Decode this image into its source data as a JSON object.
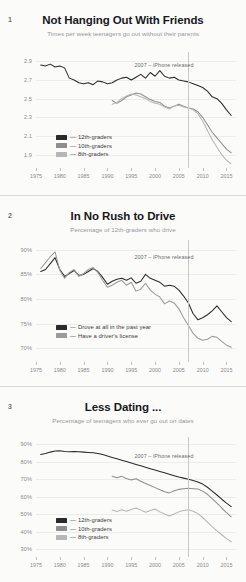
{
  "annotation": {
    "label": "2007 – iPhone released"
  },
  "xaxis": {
    "ticks": [
      1975,
      1980,
      1985,
      1990,
      1995,
      2000,
      2005,
      2010,
      2015
    ],
    "min": 1975,
    "max": 2017
  },
  "panels": [
    {
      "number": "1",
      "title": "Not Hanging Out With Friends",
      "subtitle": "Times per week teenagers go out without their parents",
      "ylabels": [
        "2.9",
        "2.7",
        "2.5",
        "2.3",
        "2.1",
        "1.9"
      ],
      "legend": [
        {
          "label": "12th-graders",
          "color": "#2b2b2d"
        },
        {
          "label": "10th-graders",
          "color": "#8e8e91"
        },
        {
          "label": "8th-graders",
          "color": "#b6b6b8"
        }
      ]
    },
    {
      "number": "2",
      "title": "In No Rush to Drive",
      "subtitle": "Percentage of 12th-graders who drive",
      "ylabels": [
        "90%",
        "85%",
        "80%",
        "75%",
        "70%"
      ],
      "legend": [
        {
          "label": "Drove at all in the past year",
          "color": "#2b2b2d"
        },
        {
          "label": "Have a driver's license",
          "color": "#9b9b9e"
        }
      ]
    },
    {
      "number": "3",
      "title": "Less Dating ...",
      "subtitle": "Percentage of teenagers who ever go out on dates",
      "ylabels": [
        "90%",
        "80%",
        "70%",
        "60%",
        "50%",
        "40%",
        "30%"
      ],
      "legend": [
        {
          "label": "12th-graders",
          "color": "#2b2b2d"
        },
        {
          "label": "10th-graders",
          "color": "#8e8e91"
        },
        {
          "label": "8th-graders",
          "color": "#b6b6b8"
        }
      ]
    }
  ],
  "chart_data": [
    {
      "type": "line",
      "title": "Not Hanging Out With Friends",
      "subtitle": "Times per week teenagers go out without their parents",
      "xlabel": "",
      "ylabel": "Times per week",
      "ylim": [
        1.8,
        3.0
      ],
      "xlim": [
        1975,
        2017
      ],
      "yticks": [
        1.9,
        2.1,
        2.3,
        2.5,
        2.7,
        2.9
      ],
      "grid": true,
      "legend_position": "lower-left",
      "annotations": [
        {
          "x": 2007,
          "text": "2007 – iPhone released",
          "type": "vline"
        }
      ],
      "series": [
        {
          "name": "12th-graders",
          "color": "#2b2b2d",
          "x": [
            1976,
            1977,
            1978,
            1979,
            1980,
            1981,
            1982,
            1983,
            1984,
            1985,
            1986,
            1987,
            1988,
            1989,
            1990,
            1991,
            1992,
            1993,
            1994,
            1995,
            1996,
            1997,
            1998,
            1999,
            2000,
            2001,
            2002,
            2003,
            2004,
            2005,
            2006,
            2007,
            2008,
            2009,
            2010,
            2011,
            2012,
            2013,
            2014,
            2015,
            2016
          ],
          "values": [
            2.86,
            2.85,
            2.87,
            2.84,
            2.85,
            2.83,
            2.72,
            2.7,
            2.67,
            2.66,
            2.67,
            2.65,
            2.69,
            2.68,
            2.66,
            2.67,
            2.7,
            2.72,
            2.73,
            2.7,
            2.73,
            2.76,
            2.72,
            2.78,
            2.74,
            2.8,
            2.74,
            2.72,
            2.73,
            2.7,
            2.69,
            2.68,
            2.66,
            2.64,
            2.62,
            2.58,
            2.52,
            2.5,
            2.45,
            2.38,
            2.32
          ]
        },
        {
          "name": "10th-graders",
          "color": "#8e8e91",
          "x": [
            1991,
            1992,
            1993,
            1994,
            1995,
            1996,
            1997,
            1998,
            1999,
            2000,
            2001,
            2002,
            2003,
            2004,
            2005,
            2006,
            2007,
            2008,
            2009,
            2010,
            2011,
            2012,
            2013,
            2014,
            2015,
            2016
          ],
          "values": [
            2.48,
            2.45,
            2.48,
            2.52,
            2.54,
            2.56,
            2.55,
            2.52,
            2.49,
            2.47,
            2.46,
            2.42,
            2.4,
            2.42,
            2.44,
            2.42,
            2.4,
            2.39,
            2.36,
            2.3,
            2.22,
            2.14,
            2.08,
            2.02,
            1.96,
            1.92
          ]
        },
        {
          "name": "8th-graders",
          "color": "#b6b6b8",
          "x": [
            1991,
            1992,
            1993,
            1994,
            1995,
            1996,
            1997,
            1998,
            1999,
            2000,
            2001,
            2002,
            2003,
            2004,
            2005,
            2006,
            2007,
            2008,
            2009,
            2010,
            2011,
            2012,
            2013,
            2014,
            2015,
            2016
          ],
          "values": [
            2.44,
            2.46,
            2.5,
            2.53,
            2.55,
            2.54,
            2.52,
            2.5,
            2.47,
            2.45,
            2.44,
            2.41,
            2.39,
            2.42,
            2.43,
            2.41,
            2.4,
            2.38,
            2.34,
            2.26,
            2.16,
            2.06,
            1.98,
            1.9,
            1.84,
            1.8
          ]
        }
      ]
    },
    {
      "type": "line",
      "title": "In No Rush to Drive",
      "subtitle": "Percentage of 12th-graders who drive",
      "xlabel": "",
      "ylabel": "Percent",
      "ylim": [
        68,
        92
      ],
      "xlim": [
        1975,
        2017
      ],
      "yticks": [
        70,
        75,
        80,
        85,
        90
      ],
      "grid": true,
      "legend_position": "lower-left",
      "annotations": [
        {
          "x": 2007,
          "text": "2007 – iPhone released",
          "type": "vline"
        }
      ],
      "series": [
        {
          "name": "Drove at all in the past year",
          "color": "#2b2b2d",
          "x": [
            1976,
            1977,
            1978,
            1979,
            1980,
            1981,
            1982,
            1983,
            1984,
            1985,
            1986,
            1987,
            1988,
            1989,
            1990,
            1991,
            1992,
            1993,
            1994,
            1995,
            1996,
            1997,
            1998,
            1999,
            2000,
            2001,
            2002,
            2003,
            2004,
            2005,
            2006,
            2007,
            2008,
            2009,
            2010,
            2011,
            2012,
            2013,
            2014,
            2015,
            2016
          ],
          "values": [
            85.6,
            86.0,
            87.2,
            88.4,
            86.0,
            84.6,
            85.2,
            85.8,
            84.8,
            85.0,
            85.6,
            86.2,
            85.6,
            84.4,
            83.0,
            83.6,
            84.0,
            84.2,
            83.8,
            84.3,
            83.2,
            83.6,
            85.0,
            84.2,
            83.8,
            83.4,
            82.6,
            82.8,
            82.6,
            81.8,
            80.6,
            79.2,
            77.0,
            75.8,
            76.2,
            76.8,
            77.6,
            78.6,
            77.4,
            76.2,
            75.4
          ]
        },
        {
          "name": "Have a driver's license",
          "color": "#9b9b9e",
          "x": [
            1976,
            1977,
            1978,
            1979,
            1980,
            1981,
            1982,
            1983,
            1984,
            1985,
            1986,
            1987,
            1988,
            1989,
            1990,
            1991,
            1992,
            1993,
            1994,
            1995,
            1996,
            1997,
            1998,
            1999,
            2000,
            2001,
            2002,
            2003,
            2004,
            2005,
            2006,
            2007,
            2008,
            2009,
            2010,
            2011,
            2012,
            2013,
            2014,
            2015,
            2016
          ],
          "values": [
            86.2,
            87.4,
            88.6,
            89.6,
            85.8,
            84.2,
            85.4,
            86.0,
            84.6,
            85.2,
            86.0,
            86.4,
            85.4,
            83.8,
            82.4,
            82.8,
            83.4,
            83.8,
            82.8,
            83.4,
            81.6,
            82.0,
            83.2,
            81.8,
            81.0,
            80.4,
            79.0,
            79.6,
            79.2,
            78.0,
            76.2,
            74.6,
            73.0,
            72.0,
            71.6,
            71.8,
            72.4,
            72.2,
            71.4,
            70.6,
            70.2
          ]
        }
      ]
    },
    {
      "type": "line",
      "title": "Less Dating ...",
      "subtitle": "Percentage of teenagers who ever go out on dates",
      "xlabel": "",
      "ylabel": "Percent",
      "ylim": [
        28,
        94
      ],
      "xlim": [
        1975,
        2017
      ],
      "yticks": [
        30,
        40,
        50,
        60,
        70,
        80,
        90
      ],
      "grid": true,
      "legend_position": "lower-left",
      "annotations": [
        {
          "x": 2007,
          "text": "2007 – iPhone released",
          "type": "vline"
        }
      ],
      "series": [
        {
          "name": "12th-graders",
          "color": "#2b2b2d",
          "x": [
            1976,
            1977,
            1978,
            1979,
            1980,
            1981,
            1982,
            1983,
            1984,
            1985,
            1986,
            1987,
            1988,
            1989,
            1990,
            1991,
            1992,
            1993,
            1994,
            1995,
            1996,
            1997,
            1998,
            1999,
            2000,
            2001,
            2002,
            2003,
            2004,
            2005,
            2006,
            2007,
            2008,
            2009,
            2010,
            2011,
            2012,
            2013,
            2014,
            2015,
            2016
          ],
          "values": [
            84.0,
            84.6,
            85.4,
            86.0,
            86.2,
            85.8,
            85.6,
            85.8,
            85.6,
            85.4,
            85.2,
            85.0,
            84.6,
            84.0,
            83.2,
            82.4,
            81.6,
            80.8,
            80.0,
            79.2,
            78.4,
            77.6,
            76.8,
            76.0,
            75.2,
            74.4,
            73.6,
            72.8,
            72.0,
            71.2,
            70.6,
            70.0,
            69.2,
            68.4,
            67.2,
            65.4,
            63.2,
            61.0,
            58.6,
            56.4,
            54.4
          ]
        },
        {
          "name": "10th-graders",
          "color": "#8e8e91",
          "x": [
            1991,
            1992,
            1993,
            1994,
            1995,
            1996,
            1997,
            1998,
            1999,
            2000,
            2001,
            2002,
            2003,
            2004,
            2005,
            2006,
            2007,
            2008,
            2009,
            2010,
            2011,
            2012,
            2013,
            2014,
            2015,
            2016
          ],
          "values": [
            71.6,
            70.8,
            71.6,
            70.4,
            69.6,
            70.2,
            68.8,
            67.6,
            66.4,
            65.2,
            64.0,
            62.8,
            62.2,
            63.4,
            64.2,
            64.6,
            64.8,
            64.6,
            64.4,
            63.2,
            61.4,
            59.0,
            56.4,
            53.6,
            51.0,
            48.6
          ]
        },
        {
          "name": "8th-graders",
          "color": "#b6b6b8",
          "x": [
            1991,
            1992,
            1993,
            1994,
            1995,
            1996,
            1997,
            1998,
            1999,
            2000,
            2001,
            2002,
            2003,
            2004,
            2005,
            2006,
            2007,
            2008,
            2009,
            2010,
            2011,
            2012,
            2013,
            2014,
            2015,
            2016
          ],
          "values": [
            52.4,
            51.6,
            52.6,
            51.8,
            52.8,
            53.6,
            52.4,
            51.2,
            52.2,
            53.0,
            51.4,
            50.2,
            49.0,
            50.2,
            51.4,
            52.2,
            52.6,
            51.8,
            50.4,
            48.2,
            45.6,
            43.0,
            40.6,
            38.4,
            36.2,
            34.4
          ]
        }
      ]
    }
  ]
}
